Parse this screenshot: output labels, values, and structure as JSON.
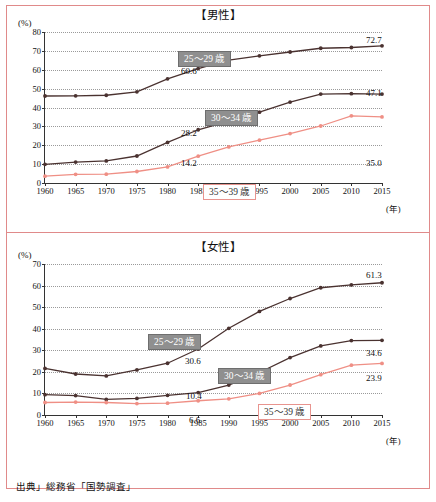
{
  "source_note": "出典」総務省「国勢調査」",
  "colors": {
    "dark_series": "#4a3230",
    "pink_series": "#ef8f85",
    "frame": "#e08a8a",
    "label_gray": "#8f8f8f"
  },
  "charts": [
    {
      "title": "【男性】",
      "unit": "(%)",
      "xunit": "(年)"
    },
    {
      "title": "【女性】",
      "unit": "(%)",
      "xunit": "(年)"
    }
  ],
  "chart_data": [
    {
      "type": "line",
      "title": "【男性】",
      "xlabel": "(年)",
      "ylabel": "(%)",
      "ylim": [
        0,
        80
      ],
      "yticks": [
        0,
        10,
        20,
        30,
        40,
        50,
        60,
        70,
        80
      ],
      "xlim": [
        1960,
        2015
      ],
      "x": [
        1960,
        1965,
        1970,
        1975,
        1980,
        1985,
        1990,
        1995,
        2000,
        2005,
        2010,
        2015
      ],
      "xticks": [
        "1960",
        "1965",
        "1970",
        "1975",
        "1980",
        "1985",
        "1990",
        "1995",
        "2000",
        "2005",
        "2010",
        "2015"
      ],
      "grid": true,
      "legend_position": "inline-annotations",
      "series": [
        {
          "name": "25〜29 歳",
          "color": "#4a3230",
          "values": [
            46.1,
            46.2,
            46.5,
            48.3,
            55.2,
            60.6,
            65.1,
            67.4,
            69.4,
            71.4,
            71.8,
            72.7
          ]
        },
        {
          "name": "30〜34 歳",
          "color": "#4a3230",
          "values": [
            9.9,
            11.1,
            11.7,
            14.3,
            21.5,
            28.2,
            32.8,
            37.5,
            42.9,
            47.1,
            47.3,
            47.1
          ]
        },
        {
          "name": "35〜39 歳",
          "color": "#ef8f85",
          "values": [
            3.6,
            4.6,
            4.7,
            6.1,
            8.5,
            14.2,
            19.1,
            22.7,
            26.2,
            30.2,
            35.6,
            35.0
          ]
        }
      ],
      "annotations": [
        {
          "text": "25〜29 歳",
          "style": "gray-box"
        },
        {
          "text": "30〜34 歳",
          "style": "gray-box"
        },
        {
          "text": "35〜39 歳",
          "style": "pink-box"
        },
        {
          "text": "60.6",
          "style": "value"
        },
        {
          "text": "72.7",
          "style": "value"
        },
        {
          "text": "28.2",
          "style": "value"
        },
        {
          "text": "47.1",
          "style": "value"
        },
        {
          "text": "14.2",
          "style": "value"
        },
        {
          "text": "35.0",
          "style": "value"
        }
      ]
    },
    {
      "type": "line",
      "title": "【女性】",
      "xlabel": "(年)",
      "ylabel": "(%)",
      "ylim": [
        0,
        70
      ],
      "yticks": [
        0,
        10,
        20,
        30,
        40,
        50,
        60,
        70
      ],
      "xlim": [
        1960,
        2015
      ],
      "x": [
        1960,
        1965,
        1970,
        1975,
        1980,
        1985,
        1990,
        1995,
        2000,
        2005,
        2010,
        2015
      ],
      "xticks": [
        "1960",
        "1965",
        "1970",
        "1975",
        "1980",
        "1985",
        "1990",
        "1995",
        "2000",
        "2005",
        "2010",
        "2015"
      ],
      "grid": true,
      "legend_position": "inline-annotations",
      "series": [
        {
          "name": "25〜29 歳",
          "color": "#4a3230",
          "values": [
            21.6,
            19.0,
            18.1,
            20.9,
            24.0,
            30.6,
            40.2,
            48.0,
            54.0,
            59.0,
            60.3,
            61.3
          ]
        },
        {
          "name": "30〜34 歳",
          "color": "#4a3230",
          "values": [
            9.4,
            9.0,
            7.2,
            7.7,
            9.1,
            10.4,
            13.9,
            19.7,
            26.6,
            32.0,
            34.5,
            34.6
          ]
        },
        {
          "name": "35〜39 歳",
          "color": "#ef8f85",
          "values": [
            5.8,
            6.0,
            5.8,
            5.3,
            5.5,
            6.6,
            7.5,
            10.0,
            13.9,
            18.7,
            23.1,
            23.9
          ]
        }
      ],
      "annotations": [
        {
          "text": "25〜29 歳",
          "style": "gray-box"
        },
        {
          "text": "30〜34 歳",
          "style": "gray-box"
        },
        {
          "text": "35〜39 歳",
          "style": "pink-box"
        },
        {
          "text": "30.6",
          "style": "value"
        },
        {
          "text": "61.3",
          "style": "value"
        },
        {
          "text": "10.4",
          "style": "value"
        },
        {
          "text": "34.6",
          "style": "value"
        },
        {
          "text": "6.6",
          "style": "value"
        },
        {
          "text": "23.9",
          "style": "value"
        }
      ]
    }
  ]
}
